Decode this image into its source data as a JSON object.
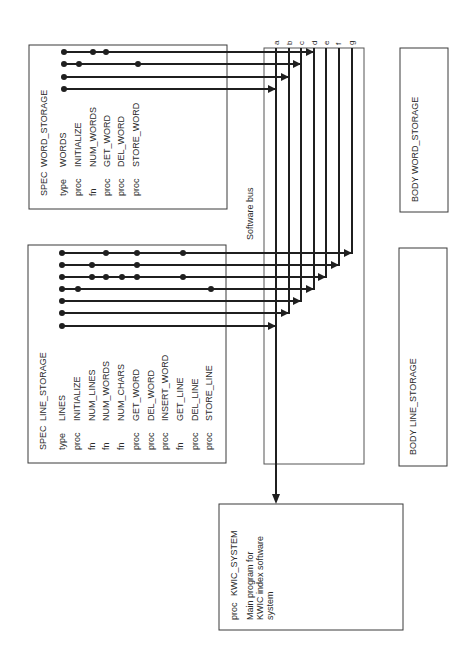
{
  "diagram": {
    "bus_label": "Software bus",
    "bus_lines": [
      "a",
      "b",
      "c",
      "d",
      "e",
      "f",
      "g"
    ],
    "word_storage_spec": {
      "keyword": "SPEC",
      "name": "WORD_STORAGE",
      "entries": [
        {
          "kind": "type",
          "name": "WORDS"
        },
        {
          "kind": "proc",
          "name": "INITIALIZE"
        },
        {
          "kind": "fn",
          "name": "NUM_WORDS"
        },
        {
          "kind": "proc",
          "name": "GET_WORD"
        },
        {
          "kind": "proc",
          "name": "DEL_WORD"
        },
        {
          "kind": "proc",
          "name": "STORE_WORD"
        }
      ]
    },
    "line_storage_spec": {
      "keyword": "SPEC",
      "name": "LINE_STORAGE",
      "entries": [
        {
          "kind": "type",
          "name": "LINES"
        },
        {
          "kind": "proc",
          "name": "INITIALIZE"
        },
        {
          "kind": "fn",
          "name": "NUM_LINES"
        },
        {
          "kind": "fn",
          "name": "NUM_WORDS"
        },
        {
          "kind": "fn",
          "name": "NUM_CHARS"
        },
        {
          "kind": "proc",
          "name": "GET_WORD"
        },
        {
          "kind": "proc",
          "name": "DEL_WORD"
        },
        {
          "kind": "proc",
          "name": "INSERT_WORD"
        },
        {
          "kind": "fn",
          "name": "GET_LINE"
        },
        {
          "kind": "proc",
          "name": "DEL_LINE"
        },
        {
          "kind": "proc",
          "name": "STORE_LINE"
        }
      ]
    },
    "word_storage_body": {
      "keyword": "BODY",
      "name": "WORD_STORAGE"
    },
    "line_storage_body": {
      "keyword": "BODY",
      "name": "LINE_STORAGE"
    },
    "kwic_system": {
      "kind": "proc",
      "name": "KWIC_SYSTEM",
      "description": [
        "Main program for",
        "KWIC index software",
        "system"
      ]
    },
    "colors": {
      "ink": "#1f1f1f",
      "box": "#3a3a3a",
      "background": "#ffffff"
    }
  }
}
